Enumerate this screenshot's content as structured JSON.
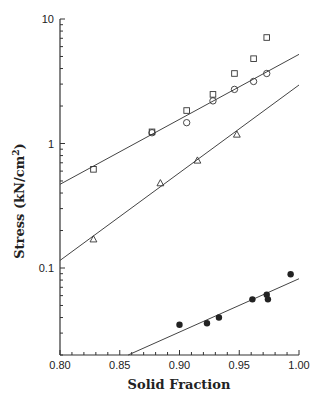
{
  "chart_data": {
    "type": "scatter",
    "title": "",
    "xlabel": "Solid Fraction",
    "ylabel": "Stress (kN/cm²)",
    "ylabel_parts": {
      "main": "Stress (kN/cm",
      "sup": "2",
      "close": ")"
    },
    "xscale": "linear",
    "yscale": "log",
    "xlim": [
      0.8,
      1.0
    ],
    "ylim": [
      0.02,
      10
    ],
    "xticks": [
      0.8,
      0.85,
      0.9,
      0.95,
      1.0
    ],
    "xtick_labels": [
      "0.80",
      "0.85",
      "0.90",
      "0.95",
      "1.00"
    ],
    "yticks": [
      0.1,
      1,
      10
    ],
    "ytick_labels": [
      "0.1",
      "1",
      "10"
    ],
    "grid": false,
    "legend": null,
    "series": [
      {
        "name": "squares",
        "marker": "square-open",
        "x": [
          0.828,
          0.877,
          0.906,
          0.928,
          0.946,
          0.962,
          0.973
        ],
        "y": [
          0.62,
          1.24,
          1.84,
          2.48,
          3.65,
          4.8,
          7.1
        ]
      },
      {
        "name": "circles",
        "marker": "circle-open",
        "x": [
          0.877,
          0.906,
          0.928,
          0.946,
          0.962,
          0.973
        ],
        "y": [
          1.22,
          1.47,
          2.2,
          2.72,
          3.15,
          3.65
        ]
      },
      {
        "name": "triangles",
        "marker": "triangle-open",
        "x": [
          0.828,
          0.884,
          0.915,
          0.948
        ],
        "y": [
          0.17,
          0.48,
          0.73,
          1.18
        ]
      },
      {
        "name": "filled circles",
        "marker": "circle-filled",
        "x": [
          0.9,
          0.923,
          0.933,
          0.961,
          0.973,
          0.974,
          0.993
        ],
        "y": [
          0.035,
          0.036,
          0.04,
          0.056,
          0.061,
          0.056,
          0.089
        ]
      }
    ],
    "fit_lines": [
      {
        "name": "fit-upper",
        "x": [
          0.8,
          1.0
        ],
        "y": [
          0.47,
          5.2
        ]
      },
      {
        "name": "fit-middle",
        "x": [
          0.8,
          1.0
        ],
        "y": [
          0.115,
          2.95
        ]
      },
      {
        "name": "fit-lower",
        "x": [
          0.857,
          1.0
        ],
        "y": [
          0.02,
          0.082
        ]
      }
    ]
  }
}
